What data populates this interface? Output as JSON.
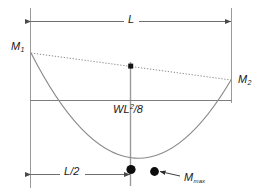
{
  "figure": {
    "name": "bending-moment-diagram",
    "background_color": "#ffffff",
    "line_color": "#7a7a7a",
    "marker_color": "#0d0d0d",
    "text_color": "#1a1a1a"
  },
  "labels": {
    "span": "L",
    "span_half": "L/2",
    "moment_left": "M",
    "moment_left_sub": "1",
    "moment_right": "M",
    "moment_right_sub": "2",
    "free_moment": "WL",
    "free_moment_sup": "2",
    "free_moment_tail": "/8",
    "max_moment": "M",
    "max_moment_sub": "max"
  },
  "geometry": {
    "left_x": 30,
    "right_x": 232,
    "center_x": 131,
    "dim_top_y": 21,
    "dim_bottom_y": 174,
    "baseline_y": 100,
    "m1_y": 53,
    "m2_y": 80,
    "curve_bottom_y": 170,
    "dot_center_x": 131,
    "dot_center_y": 170,
    "dot_right_x": 154,
    "dot_right_y": 172,
    "square_marker_x": 131,
    "square_marker_y": 66
  }
}
